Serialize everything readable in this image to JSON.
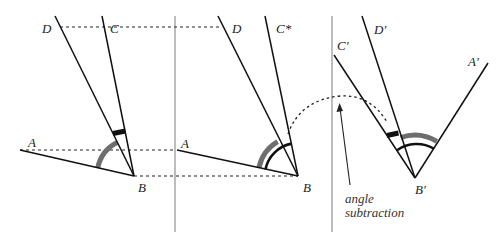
{
  "figure": {
    "panels": [
      {
        "id": "panel-1",
        "labels": {
          "A": "A",
          "B": "B",
          "C": "C",
          "D": "D"
        }
      },
      {
        "id": "panel-2",
        "labels": {
          "A": "A",
          "B": "B",
          "C": "C*",
          "D": "D"
        }
      },
      {
        "id": "panel-3",
        "labels": {
          "A": "A′",
          "B": "B′",
          "C": "C′",
          "D": "D′"
        },
        "annotation_line1": "angle",
        "annotation_line2": "subtraction"
      }
    ],
    "colors": {
      "line": "#111111",
      "gray_arc": "#6e6e6e",
      "divider": "#9a9a9a",
      "dashed": "#222222"
    }
  }
}
